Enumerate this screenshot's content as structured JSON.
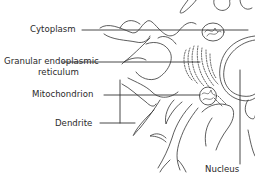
{
  "diagram": {
    "stroke_color": "#333333",
    "background": "#ffffff",
    "labels": [
      {
        "id": "cytoplasm",
        "text": "Cytoplasm"
      },
      {
        "id": "rer_line1",
        "text": "Granular endoplasmic"
      },
      {
        "id": "rer_line2",
        "text": "reticulum"
      },
      {
        "id": "mitochondrion",
        "text": "Mitochondrion"
      },
      {
        "id": "dendrite",
        "text": "Dendrite"
      },
      {
        "id": "nucleus",
        "text": "Nucleus"
      }
    ]
  }
}
